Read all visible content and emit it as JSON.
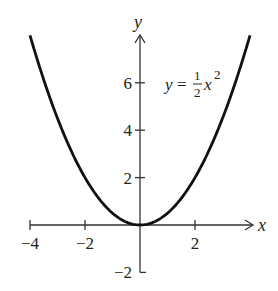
{
  "chart_data": {
    "type": "line",
    "title": "",
    "xlabel": "x",
    "ylabel": "y",
    "xlim": [
      -4,
      4
    ],
    "ylim": [
      -2,
      8
    ],
    "grid": false,
    "legend": null,
    "x_ticks": [
      -4,
      -2,
      2
    ],
    "x_tick_labels": [
      "−4",
      "−2",
      "2"
    ],
    "y_ticks": [
      -2,
      2,
      4,
      6
    ],
    "y_tick_labels": [
      "−2",
      "2",
      "4",
      "6"
    ],
    "series": [
      {
        "name": "y = 1/2 x^2",
        "function": "0.5*x^2",
        "x": [
          -4,
          -3.5,
          -3,
          -2.5,
          -2,
          -1.5,
          -1,
          -0.5,
          0,
          0.5,
          1,
          1.5,
          2,
          2.5,
          3,
          3.5,
          4
        ],
        "y": [
          8,
          6.125,
          4.5,
          3.125,
          2,
          1.125,
          0.5,
          0.125,
          0,
          0.125,
          0.5,
          1.125,
          2,
          3.125,
          4.5,
          6.125,
          8
        ]
      }
    ],
    "annotations": [
      {
        "text": "y = ½ x²",
        "at": [
          1.0,
          6
        ]
      }
    ]
  },
  "equation": {
    "lhs": "y",
    "equals": "=",
    "num": "1",
    "den": "2",
    "var": "x",
    "exp": "2"
  },
  "colors": {
    "ink": "#111111",
    "axis": "#333333",
    "background": "#ffffff"
  }
}
